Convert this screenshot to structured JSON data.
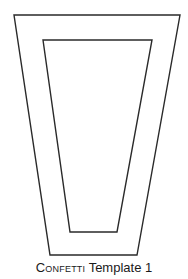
{
  "figure": {
    "stroke_color": "#2a2a2a",
    "background": "#ffffff",
    "outer_shape": {
      "points": "14,15 180,15 137,255 50,255"
    },
    "inner_shape": {
      "points": "43,40 152,40 117,232 70,232"
    }
  },
  "caption": {
    "prefix": "Confetti",
    "suffix": " Template 1"
  }
}
